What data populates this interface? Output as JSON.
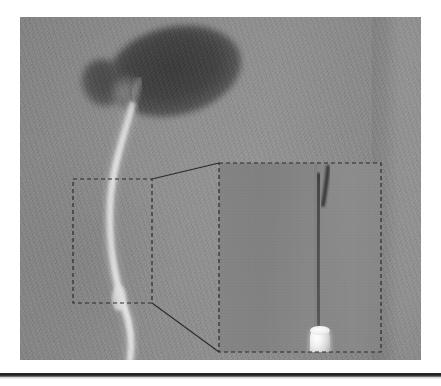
{
  "figure": {
    "caption": "",
    "modality_label": "fluoroscopic radiograph",
    "panel_label": ""
  },
  "radiograph": {
    "background_tone": "#8c8c8c",
    "plate": {
      "x": 20,
      "y": 17,
      "width": 401,
      "height": 343
    },
    "right_band": {
      "label": "bright collimation band",
      "x_start": 366,
      "width": 58
    }
  },
  "anatomy": {
    "mass": {
      "name": "contrast-filled rounded mass",
      "color": "#434343",
      "center_x": 154,
      "center_y": 54,
      "width": 136,
      "height": 88,
      "rotation_deg": -13
    },
    "lobe": {
      "name": "small adjacent lobe",
      "color": "#4b4b4b",
      "center_x": 83,
      "center_y": 66
    },
    "tube": {
      "name": "bright curvilinear tube",
      "color": "#d6d6d6",
      "description": "radiolucent tube descending from the mass to the lower border"
    }
  },
  "annotations": {
    "roi_box": {
      "name": "region-of-interest box",
      "style": "dashed",
      "color": "#2b2b2b",
      "x": 53,
      "y": 162,
      "width": 79,
      "height": 124
    },
    "inset_box": {
      "name": "magnified inset frame",
      "style": "dashed",
      "color": "#2b2b2b",
      "x": 199,
      "y": 146,
      "width": 162,
      "height": 189
    },
    "connector_top": {
      "name": "upper leader line",
      "from_x": 132,
      "from_y": 162,
      "to_x": 199,
      "to_y": 146
    },
    "connector_bottom": {
      "name": "lower leader line",
      "from_x": 132,
      "from_y": 286,
      "to_x": 199,
      "to_y": 335
    }
  },
  "inset": {
    "wire": {
      "name": "dark guidewire / catheter shaft",
      "color": "#565656",
      "x_center": 101,
      "top": 8,
      "bottom": 166
    },
    "wire_tip": {
      "name": "dark distal tip segment",
      "color": "#3c3c3c"
    },
    "marker": {
      "name": "radiopaque marker band",
      "color": "#ffffff",
      "x": 91,
      "y": 163,
      "width": 20,
      "height": 32
    },
    "shaft_below": {
      "name": "tube distal to marker",
      "color": "#9e9e9e"
    }
  },
  "footer": {
    "rule_color": "#1d1d1d",
    "rule_y": 373
  }
}
